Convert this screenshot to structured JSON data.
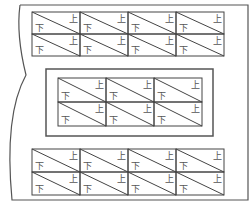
{
  "diagram": {
    "colors": {
      "line": "#444444",
      "text": "#555555",
      "frame": "#555555"
    },
    "container": {
      "x": 12,
      "y": 5,
      "right": 248,
      "bottom": 200
    },
    "cell_labels": {
      "top_right": "上",
      "bottom_left": "下"
    },
    "grids": [
      {
        "name": "top-grid",
        "x": 32,
        "y": 12,
        "cols": 4,
        "rows": 2,
        "cell_w": 48,
        "cell_h": 22
      },
      {
        "name": "middle-grid",
        "x": 58,
        "y": 78,
        "cols": 3,
        "rows": 2,
        "cell_w": 48,
        "cell_h": 24,
        "frame": {
          "x": 46,
          "y": 69,
          "w": 167,
          "h": 67
        }
      },
      {
        "name": "bottom-grid",
        "x": 32,
        "y": 149,
        "cols": 4,
        "rows": 2,
        "cell_w": 48,
        "cell_h": 23
      }
    ]
  }
}
